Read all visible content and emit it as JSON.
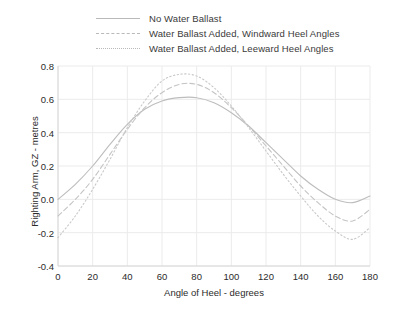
{
  "chart_data": {
    "type": "line",
    "title": "",
    "xlabel": "Angle of Heel - degrees",
    "ylabel": "Righting Arm, GZ - metres",
    "xlim": [
      0,
      180
    ],
    "ylim": [
      -0.4,
      0.8
    ],
    "xticks": [
      "0",
      "20",
      "40",
      "60",
      "80",
      "100",
      "120",
      "140",
      "160",
      "180"
    ],
    "yticks": [
      "0.8",
      "0.6",
      "0.4",
      "0.2",
      "0.0",
      "-0.2",
      "-0.4"
    ],
    "grid": true,
    "legend_position": "top-center",
    "x": [
      0,
      10,
      20,
      30,
      40,
      50,
      60,
      70,
      80,
      90,
      100,
      110,
      120,
      130,
      140,
      150,
      160,
      170,
      180
    ],
    "series": [
      {
        "name": "No Water Ballast",
        "style": "solid",
        "color": "#bdbdbd",
        "values": [
          0.0,
          0.09,
          0.2,
          0.33,
          0.45,
          0.54,
          0.59,
          0.61,
          0.61,
          0.58,
          0.52,
          0.44,
          0.34,
          0.24,
          0.14,
          0.06,
          0.0,
          -0.02,
          0.02
        ]
      },
      {
        "name": "Water Ballast Added, Windward Heel Angles",
        "style": "dashed",
        "color": "#c4c4c4",
        "values": [
          -0.1,
          0.0,
          0.12,
          0.27,
          0.42,
          0.55,
          0.64,
          0.69,
          0.69,
          0.64,
          0.55,
          0.44,
          0.32,
          0.2,
          0.08,
          -0.02,
          -0.1,
          -0.13,
          -0.06
        ]
      },
      {
        "name": "Water Ballast Added, Leeward Heel Angles",
        "style": "dotted",
        "color": "#c9c9c9",
        "values": [
          -0.23,
          -0.1,
          0.06,
          0.24,
          0.43,
          0.59,
          0.71,
          0.75,
          0.74,
          0.67,
          0.56,
          0.43,
          0.29,
          0.15,
          0.02,
          -0.1,
          -0.19,
          -0.24,
          -0.17
        ]
      }
    ]
  },
  "legend": {
    "items": [
      {
        "label": "No Water Ballast",
        "style": "solid"
      },
      {
        "label": "Water Ballast Added, Windward Heel Angles",
        "style": "dashed"
      },
      {
        "label": "Water Ballast Added, Leeward Heel Angles",
        "style": "dotted"
      }
    ]
  },
  "colors": {
    "background": "#ffffff",
    "grid": "#ebebeb",
    "axis": "#d8d8d8",
    "text": "#2b2b2b",
    "line": "#bdbdbd"
  }
}
